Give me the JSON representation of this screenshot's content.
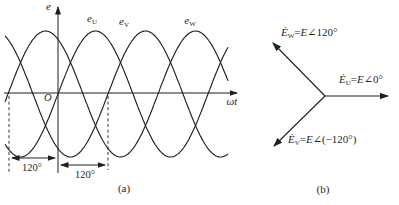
{
  "colors": {
    "ink": "#1f1f1f",
    "background": "#ffffff"
  },
  "figure": {
    "panel_a": {
      "caption": "(a)",
      "y_axis_label": "e",
      "x_axis_label": "ωt",
      "origin_label": "O",
      "curves": [
        {
          "base": "e",
          "sub": "U"
        },
        {
          "base": "e",
          "sub": "V"
        },
        {
          "base": "e",
          "sub": "W"
        }
      ],
      "interval_labels": [
        "120°",
        "120°"
      ]
    },
    "panel_b": {
      "caption": "(b)",
      "phasors": [
        {
          "var": "Ė",
          "sub": "W",
          "equals": "=",
          "magnitude": "E",
          "angle": "∠120°"
        },
        {
          "var": "Ė",
          "sub": "U",
          "equals": "=",
          "magnitude": "E",
          "angle": "∠0°"
        },
        {
          "var": "Ė",
          "sub": "V",
          "equals": "=",
          "magnitude": "E",
          "angle": "∠(−120°)"
        }
      ]
    }
  },
  "chart_data": {
    "type": "line",
    "x_axis": "ωt",
    "y_axis": "e",
    "amplitude_label": "E",
    "period_deg": 360,
    "phase_spacing_deg": 120,
    "x_range_deg": [
      -127,
      408
    ],
    "series": [
      {
        "key": "eU",
        "label": "e_U",
        "phase_deg": 0,
        "phasor_angle_deg": 0
      },
      {
        "key": "eV",
        "label": "e_V",
        "phase_deg": -120,
        "phasor_angle_deg": -120
      },
      {
        "key": "eW",
        "label": "e_W",
        "phase_deg": 120,
        "phasor_angle_deg": 120
      }
    ]
  }
}
